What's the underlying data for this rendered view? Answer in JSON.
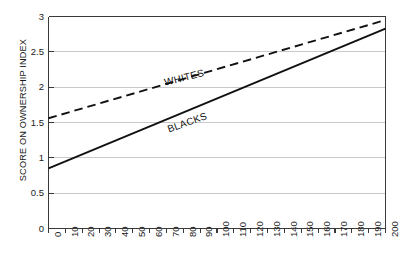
{
  "chart_data": {
    "type": "line",
    "title": "",
    "subtitle": "",
    "xlabel": "",
    "ylabel": "SCORE ON OWNERSHIP INDEX",
    "xlim": [
      0,
      200
    ],
    "ylim": [
      0,
      3
    ],
    "grid": "horizontal",
    "legend_position": "inline-on-line",
    "x_tick_labels": [
      "0",
      "10",
      "20",
      "30",
      "40",
      "50",
      "60",
      "70",
      "80",
      "90",
      "100",
      "110",
      "120",
      "130",
      "140",
      "150",
      "160",
      "170",
      "180",
      "190",
      "200"
    ],
    "x_tick_values": [
      0,
      10,
      20,
      30,
      40,
      50,
      60,
      70,
      80,
      90,
      100,
      110,
      120,
      130,
      140,
      150,
      160,
      170,
      180,
      190,
      200
    ],
    "y_tick_labels": [
      "0",
      "0.5",
      "1",
      "1.5",
      "2",
      "2.5",
      "3"
    ],
    "y_tick_values": [
      0,
      0.5,
      1,
      1.5,
      2,
      2.5,
      3
    ],
    "x": [
      0,
      200
    ],
    "series": [
      {
        "name": "WHITES",
        "style": "dashed",
        "color": "#111111",
        "values": [
          1.56,
          2.95
        ]
      },
      {
        "name": "BLACKS",
        "style": "solid",
        "color": "#111111",
        "values": [
          0.85,
          2.83
        ]
      }
    ],
    "annotations": [
      {
        "text": "WHITES",
        "series": "WHITES"
      },
      {
        "text": "BLACKS",
        "series": "BLACKS"
      }
    ],
    "colors": {
      "background": "#ffffff",
      "axis": "#3a3a3a",
      "gridline": "#c9c9c9",
      "text": "#1a1a1a",
      "line": "#111111"
    }
  }
}
